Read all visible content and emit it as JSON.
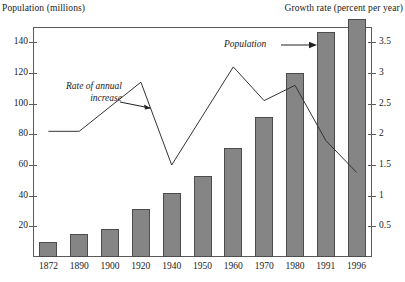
{
  "chart_data": {
    "type": "bar",
    "title": "",
    "categories": [
      "1872",
      "1890",
      "1900",
      "1920",
      "1940",
      "1950",
      "1960",
      "1970",
      "1980",
      "1991",
      "1996"
    ],
    "xlabel": "",
    "ylabel": "Population (millions)",
    "ylabel_right": "Growth rate (percent per year)",
    "ylim": [
      0,
      150
    ],
    "ylim_right": [
      0,
      3.75
    ],
    "yticks": [
      "20",
      "40",
      "60",
      "80",
      "100",
      "120",
      "140"
    ],
    "yticks_right": [
      "0.5",
      "1",
      "1.5",
      "2",
      "2.5",
      "3",
      "3.5"
    ],
    "grid": false,
    "legend_position": "none",
    "series": [
      {
        "name": "Population",
        "type": "bar",
        "axis": "left",
        "unit": "millions",
        "values": [
          10,
          15,
          18,
          31,
          42,
          53,
          71,
          91,
          120,
          147,
          155
        ]
      },
      {
        "name": "Rate of annual increase",
        "type": "line",
        "axis": "right",
        "unit": "percent per year",
        "x": [
          "1872",
          "1890",
          "1920",
          "1940",
          "1960",
          "1970",
          "1980",
          "1991",
          "1996"
        ],
        "values": [
          2.05,
          2.05,
          2.85,
          1.5,
          3.1,
          2.55,
          2.8,
          1.9,
          1.38
        ]
      }
    ],
    "annotations": [
      {
        "id": "rate-annotation",
        "text_line1": "Rate of annual",
        "text_line2": "increase",
        "points_to": "1910 line segment"
      },
      {
        "id": "population-annotation",
        "text": "Population",
        "points_to": "1996 bar"
      }
    ],
    "colors": {
      "bar_fill": "#858585",
      "bar_border": "#4c4c4c",
      "line": "#333333",
      "axis": "#5a5a5a",
      "text": "#1a1a1a"
    }
  },
  "axes": {
    "left_title": "Population (millions)",
    "right_title": "Growth rate (percent per year)"
  }
}
